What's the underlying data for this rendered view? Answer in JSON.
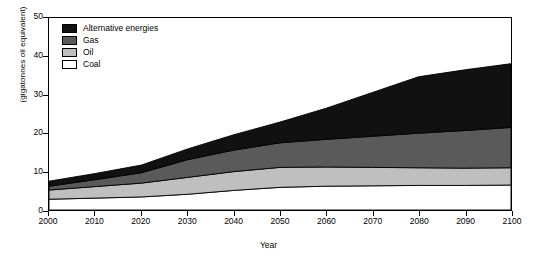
{
  "chart_data": {
    "type": "area",
    "stacked": true,
    "title": "",
    "xlabel": "Year",
    "ylabel": "(gigatonnes oil equivalent)",
    "xlim": [
      2000,
      2100
    ],
    "ylim": [
      0,
      50
    ],
    "xticks": [
      2000,
      2010,
      2020,
      2030,
      2040,
      2050,
      2060,
      2070,
      2080,
      2090,
      2100
    ],
    "yticks": [
      0,
      10,
      20,
      30,
      40,
      50
    ],
    "grid": false,
    "legend_position": "top-left",
    "x": [
      2000,
      2010,
      2020,
      2030,
      2040,
      2050,
      2060,
      2070,
      2080,
      2090,
      2100
    ],
    "series": [
      {
        "name": "Coal",
        "color": "#ffffff",
        "values": [
          2.8,
          3.1,
          3.4,
          4.1,
          5.1,
          5.9,
          6.2,
          6.3,
          6.4,
          6.4,
          6.5
        ]
      },
      {
        "name": "Oil",
        "color": "#bfbfbf",
        "values": [
          2.4,
          3.0,
          3.6,
          4.4,
          4.9,
          5.2,
          5.0,
          4.8,
          4.6,
          4.5,
          4.5
        ]
      },
      {
        "name": "Gas",
        "color": "#5a5a5a",
        "values": [
          1.0,
          1.8,
          2.7,
          4.6,
          5.6,
          6.4,
          7.2,
          8.1,
          9.0,
          9.8,
          10.5
        ]
      },
      {
        "name": "Alternative energies",
        "color": "#111111",
        "values": [
          1.3,
          1.6,
          2.0,
          2.8,
          4.0,
          5.4,
          8.1,
          11.4,
          14.7,
          15.8,
          16.6
        ]
      }
    ],
    "totals": [
      7.5,
      9.5,
      11.7,
      15.9,
      19.6,
      22.9,
      26.5,
      30.6,
      34.7,
      36.5,
      38.1
    ]
  },
  "legend": {
    "items": [
      {
        "label": "Alternative energies",
        "color": "#111111"
      },
      {
        "label": "Gas",
        "color": "#5a5a5a"
      },
      {
        "label": "Oil",
        "color": "#bfbfbf"
      },
      {
        "label": "Coal",
        "color": "#ffffff"
      }
    ]
  },
  "axes": {
    "y_title": "(gigatonnes oil equivalent)",
    "x_title": "Year",
    "y_tick_labels": [
      "50",
      "40",
      "30",
      "20",
      "10",
      "0"
    ],
    "x_tick_labels": [
      "2000",
      "2010",
      "2020",
      "2030",
      "2040",
      "2050",
      "2060",
      "2070",
      "2080",
      "2090",
      "2100"
    ]
  }
}
